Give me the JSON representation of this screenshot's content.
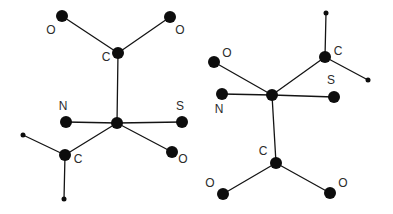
{
  "figure": {
    "kind": "molecular-structure-diagram",
    "background_color": "#ffffff",
    "line_color": "#141414",
    "atom_color": "#0d0d0d",
    "label_color": "#2b2b2b",
    "atom_major_radius": 6,
    "atom_minor_radius": 2.5,
    "bond_width": 1.3
  },
  "structures": [
    {
      "name": "structure-left",
      "atoms": [
        {
          "id": "L-O1",
          "element": "O",
          "label": "O",
          "x": 62,
          "y": 16,
          "size": "major",
          "label_x": 51,
          "label_y": 31
        },
        {
          "id": "L-O2",
          "element": "O",
          "label": "O",
          "x": 170,
          "y": 17,
          "size": "major",
          "label_x": 180,
          "label_y": 31
        },
        {
          "id": "L-C1",
          "element": "C",
          "label": "C",
          "x": 118,
          "y": 53,
          "size": "major",
          "label_x": 106,
          "label_y": 58
        },
        {
          "id": "L-N1",
          "element": "N",
          "label": "N",
          "x": 66,
          "y": 122,
          "size": "major",
          "label_x": 63,
          "label_y": 107
        },
        {
          "id": "L-S1",
          "element": "S",
          "label": "S",
          "x": 182,
          "y": 122,
          "size": "major",
          "label_x": 180,
          "label_y": 107
        },
        {
          "id": "L-X1",
          "element": "",
          "label": "",
          "x": 117,
          "y": 123,
          "size": "major",
          "label_x": null,
          "label_y": null
        },
        {
          "id": "L-O3",
          "element": "O",
          "label": "O",
          "x": 172,
          "y": 152,
          "size": "major",
          "label_x": 183,
          "label_y": 160
        },
        {
          "id": "L-C2",
          "element": "C",
          "label": "C",
          "x": 65,
          "y": 155,
          "size": "major",
          "label_x": 78,
          "label_y": 160
        },
        {
          "id": "L-R1",
          "element": "",
          "label": "",
          "x": 23,
          "y": 135,
          "size": "minor",
          "label_x": null,
          "label_y": null
        },
        {
          "id": "L-R2",
          "element": "",
          "label": "",
          "x": 64,
          "y": 199,
          "size": "minor",
          "label_x": null,
          "label_y": null
        }
      ],
      "bonds": [
        {
          "from": "L-O1",
          "to": "L-C1"
        },
        {
          "from": "L-O2",
          "to": "L-C1"
        },
        {
          "from": "L-C1",
          "to": "L-X1"
        },
        {
          "from": "L-N1",
          "to": "L-X1"
        },
        {
          "from": "L-X1",
          "to": "L-S1"
        },
        {
          "from": "L-X1",
          "to": "L-O3"
        },
        {
          "from": "L-X1",
          "to": "L-C2"
        },
        {
          "from": "L-C2",
          "to": "L-R1"
        },
        {
          "from": "L-C2",
          "to": "L-R2"
        }
      ]
    },
    {
      "name": "structure-right",
      "atoms": [
        {
          "id": "R-R1",
          "element": "",
          "label": "",
          "x": 326,
          "y": 13,
          "size": "minor",
          "label_x": null,
          "label_y": null
        },
        {
          "id": "R-C1",
          "element": "C",
          "label": "C",
          "x": 325,
          "y": 57,
          "size": "major",
          "label_x": 338,
          "label_y": 52
        },
        {
          "id": "R-O1",
          "element": "O",
          "label": "O",
          "x": 214,
          "y": 62,
          "size": "major",
          "label_x": 227,
          "label_y": 54
        },
        {
          "id": "R-R2",
          "element": "",
          "label": "",
          "x": 368,
          "y": 80,
          "size": "minor",
          "label_x": null,
          "label_y": null
        },
        {
          "id": "R-S1",
          "element": "S",
          "label": "S",
          "x": 334,
          "y": 97,
          "size": "major",
          "label_x": 331,
          "label_y": 81
        },
        {
          "id": "R-N1",
          "element": "N",
          "label": "N",
          "x": 222,
          "y": 94,
          "size": "major",
          "label_x": 219,
          "label_y": 110
        },
        {
          "id": "R-X1",
          "element": "",
          "label": "",
          "x": 272,
          "y": 95,
          "size": "major",
          "label_x": null,
          "label_y": null
        },
        {
          "id": "R-C2",
          "element": "C",
          "label": "C",
          "x": 276,
          "y": 163,
          "size": "major",
          "label_x": 263,
          "label_y": 152
        },
        {
          "id": "R-O2",
          "element": "O",
          "label": "O",
          "x": 223,
          "y": 194,
          "size": "major",
          "label_x": 210,
          "label_y": 184
        },
        {
          "id": "R-O3",
          "element": "O",
          "label": "O",
          "x": 330,
          "y": 193,
          "size": "major",
          "label_x": 343,
          "label_y": 184
        }
      ],
      "bonds": [
        {
          "from": "R-R1",
          "to": "R-C1"
        },
        {
          "from": "R-C1",
          "to": "R-R2"
        },
        {
          "from": "R-C1",
          "to": "R-X1"
        },
        {
          "from": "R-O1",
          "to": "R-X1"
        },
        {
          "from": "R-N1",
          "to": "R-X1"
        },
        {
          "from": "R-X1",
          "to": "R-S1"
        },
        {
          "from": "R-X1",
          "to": "R-C2"
        },
        {
          "from": "R-C2",
          "to": "R-O2"
        },
        {
          "from": "R-C2",
          "to": "R-O3"
        }
      ]
    }
  ]
}
